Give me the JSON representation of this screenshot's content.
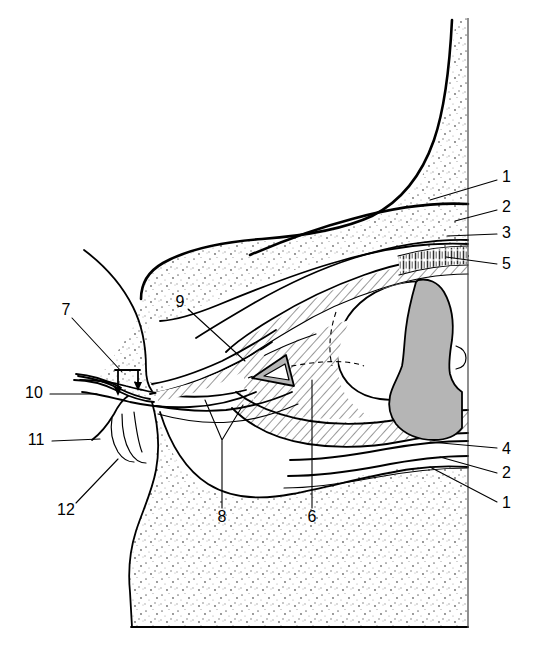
{
  "figure": {
    "background_color": "#ffffff",
    "ink_color": "#000000",
    "gray_structure_color": "#b5b5b5",
    "canvas": {
      "width": 538,
      "height": 656
    }
  },
  "labels": [
    {
      "id": "label-1-top",
      "text": "1",
      "x": 502,
      "y": 178,
      "anchor": "start",
      "leader": "M 497 180 L 430 200"
    },
    {
      "id": "label-2-top",
      "text": "2",
      "x": 502,
      "y": 208,
      "anchor": "start",
      "leader": "M 497 210 L 455 221"
    },
    {
      "id": "label-3-top",
      "text": "3",
      "x": 502,
      "y": 234,
      "anchor": "start",
      "leader": "M 497 234 L 447 236"
    },
    {
      "id": "label-5-top",
      "text": "5",
      "x": 502,
      "y": 265,
      "anchor": "start",
      "leader": "M 497 264 L 446 257"
    },
    {
      "id": "label-4-bottom",
      "text": "4",
      "x": 502,
      "y": 450,
      "anchor": "start",
      "leader": "M 497 448 L 430 442"
    },
    {
      "id": "label-2-bottom",
      "text": "2",
      "x": 502,
      "y": 474,
      "anchor": "start",
      "leader": "M 497 473 L 440 457"
    },
    {
      "id": "label-1-bottom",
      "text": "1",
      "x": 502,
      "y": 504,
      "anchor": "start",
      "leader": "M 497 502 L 430 467"
    },
    {
      "id": "label-7-left",
      "text": "7",
      "x": 66,
      "y": 311,
      "anchor": "middle",
      "leader": "M 72 318 L 122 372"
    },
    {
      "id": "label-10-left",
      "text": "10",
      "x": 34,
      "y": 394,
      "anchor": "middle",
      "leader": "M 50 394 L 97 394"
    },
    {
      "id": "label-11-left",
      "text": "11",
      "x": 36,
      "y": 441,
      "anchor": "middle",
      "leader": "M 52 441 L 100 439"
    },
    {
      "id": "label-12-left",
      "text": "12",
      "x": 66,
      "y": 511,
      "anchor": "middle",
      "leader": "M 76 503 L 118 459"
    },
    {
      "id": "label-9-mid",
      "text": "9",
      "x": 180,
      "y": 303,
      "anchor": "middle",
      "leader": "M 188 309 L 245 361"
    },
    {
      "id": "label-8-mid",
      "text": "8",
      "x": 222,
      "y": 518,
      "anchor": "middle",
      "leader": "M 222 508 L 222 440 M 222 440 L 205 400 M 222 440 L 243 405"
    },
    {
      "id": "label-6-mid",
      "text": "6",
      "x": 312,
      "y": 518,
      "anchor": "middle",
      "leader": "M 312 508 L 312 380"
    }
  ],
  "regions": [
    {
      "name": "upper-tissue-mass",
      "fill": "stipple"
    },
    {
      "name": "lower-tissue-mass",
      "fill": "stipple"
    },
    {
      "name": "left-tissue-mass",
      "fill": "stipple"
    },
    {
      "name": "upper-muscle-band",
      "fill": "hatch"
    },
    {
      "name": "lower-muscle-band",
      "fill": "hatch"
    },
    {
      "name": "central-muscle-wedge",
      "fill": "hatch"
    },
    {
      "name": "palisade-band",
      "fill": "vhatch"
    },
    {
      "name": "bone-turbinate",
      "fill": "gray"
    },
    {
      "name": "triangle-marker",
      "fill": "gray"
    },
    {
      "name": "lumen-cavity",
      "fill": "white"
    }
  ]
}
